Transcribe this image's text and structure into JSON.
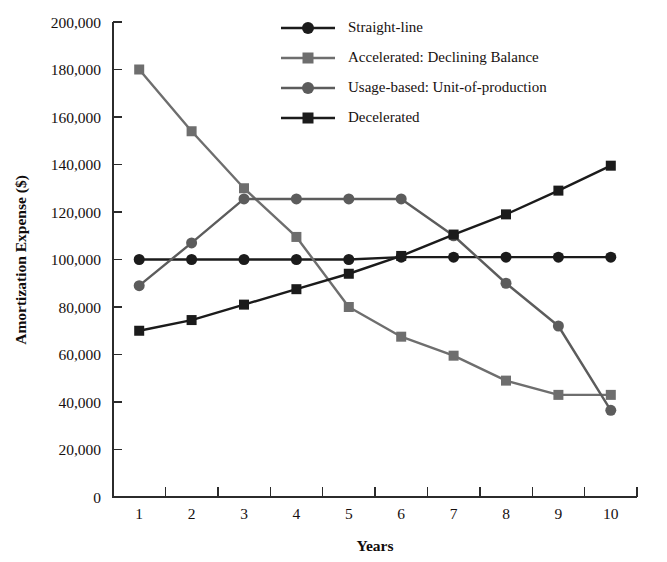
{
  "chart_data": {
    "type": "line",
    "title": "",
    "xlabel": "Years",
    "ylabel": "Amortization Expense ($)",
    "x": [
      1,
      2,
      3,
      4,
      5,
      6,
      7,
      8,
      9,
      10
    ],
    "categories": [
      "1",
      "2",
      "3",
      "4",
      "5",
      "6",
      "7",
      "8",
      "9",
      "10"
    ],
    "xlim": [
      0.5,
      10.5
    ],
    "ylim": [
      0,
      200000
    ],
    "ytick_values": [
      0,
      20000,
      40000,
      60000,
      80000,
      100000,
      120000,
      140000,
      160000,
      180000,
      200000
    ],
    "ytick_labels": [
      "0",
      "20,000",
      "40,000",
      "60,000",
      "80,000",
      "100,000",
      "120,000",
      "140,000",
      "160,000",
      "180,000",
      "200,000"
    ],
    "grid": false,
    "legend_position": "top-center",
    "series": [
      {
        "name": "Straight-line",
        "color": "#1b1b1b",
        "marker": "circle",
        "values": [
          100000,
          100000,
          100000,
          100000,
          100000,
          101000,
          101000,
          101000,
          101000,
          101000
        ]
      },
      {
        "name": "Accelerated: Declining Balance",
        "color": "#6e6e6e",
        "marker": "square",
        "values": [
          180000,
          154000,
          130000,
          109500,
          80000,
          67500,
          59500,
          49000,
          43000,
          43000
        ]
      },
      {
        "name": "Usage-based: Unit-of-production",
        "color": "#5c5c5c",
        "marker": "circle",
        "values": [
          89000,
          107000,
          125500,
          125500,
          125500,
          125500,
          110000,
          90000,
          72000,
          36500
        ]
      },
      {
        "name": "Decelerated",
        "color": "#1b1b1b",
        "marker": "square",
        "values": [
          70000,
          74500,
          81000,
          87500,
          94000,
          101500,
          110500,
          119000,
          129000,
          139500
        ]
      }
    ]
  },
  "legend": {
    "items": [
      {
        "label": "Straight-line"
      },
      {
        "label": "Accelerated: Declining Balance"
      },
      {
        "label": "Usage-based: Unit-of-production"
      },
      {
        "label": "Decelerated"
      }
    ]
  },
  "axes": {
    "y_title": "Amortization Expense ($)",
    "x_title": "Years"
  }
}
